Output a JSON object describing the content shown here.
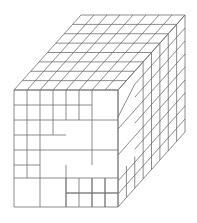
{
  "diagram": {
    "stroke_color": "#6e6e6e",
    "background": "#ffffff",
    "geometry": {
      "front": {
        "x0": 14,
        "y0": 90,
        "x1": 118,
        "y1": 207
      },
      "depth_offset": {
        "dx": 67,
        "dy": -75
      },
      "front_cols_x": [
        14,
        27,
        40,
        53,
        66,
        79,
        92,
        118
      ],
      "front_rows_y": [
        90,
        105,
        120,
        135,
        150,
        165,
        178,
        193,
        207
      ],
      "depth_divisions": 8,
      "top_cols": 8
    }
  }
}
